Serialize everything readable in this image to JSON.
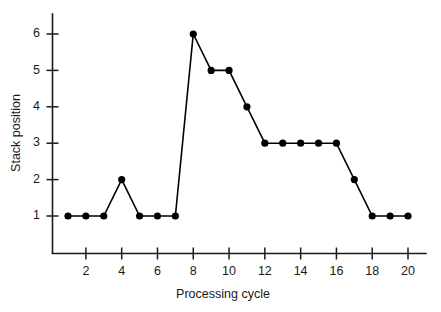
{
  "chart_data": {
    "type": "line",
    "title": "",
    "subtitle": "",
    "xlabel": "Processing cycle",
    "ylabel": "Stack position",
    "x": [
      1,
      2,
      3,
      4,
      5,
      6,
      7,
      8,
      9,
      10,
      11,
      12,
      13,
      14,
      15,
      16,
      17,
      18,
      19,
      20
    ],
    "values": [
      1,
      1,
      1,
      2,
      1,
      1,
      1,
      6,
      5,
      5,
      4,
      3,
      3,
      3,
      3,
      3,
      2,
      1,
      1,
      1
    ],
    "series": [
      {
        "name": "Stack position",
        "values": [
          1,
          1,
          1,
          2,
          1,
          1,
          1,
          6,
          5,
          5,
          4,
          3,
          3,
          3,
          3,
          3,
          2,
          1,
          1,
          1
        ],
        "color": "#000000",
        "marker": "filled-circle"
      }
    ],
    "xlim": [
      0.5,
      20.9
    ],
    "ylim": [
      0.0,
      6.6
    ],
    "xticks": [
      2,
      4,
      6,
      8,
      10,
      12,
      14,
      16,
      18,
      20
    ],
    "xtick_labels": [
      "2",
      "4",
      "6",
      "8",
      "10",
      "12",
      "14",
      "16",
      "18",
      "20"
    ],
    "yticks": [
      1,
      2,
      3,
      4,
      5,
      6
    ],
    "ytick_labels": [
      "1",
      "2",
      "3",
      "4",
      "5",
      "6"
    ],
    "grid": false,
    "legend": null,
    "legend_position": "none",
    "annotations": [],
    "background_color": "#ffffff",
    "axis_color": "#1a1a1a"
  }
}
